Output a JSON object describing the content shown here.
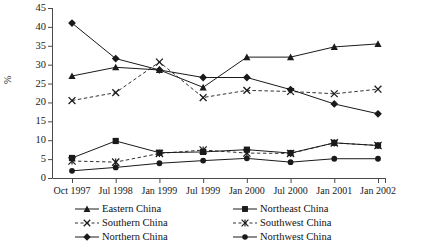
{
  "chart_data": {
    "type": "line",
    "title": "",
    "subtitle": "",
    "xlabel": "",
    "ylabel": "%",
    "ylim": [
      0,
      45
    ],
    "ytick_step": 5,
    "yticks": [
      45,
      40,
      35,
      30,
      25,
      20,
      15,
      10,
      5,
      0
    ],
    "grid": false,
    "legend_position": "bottom",
    "categories": [
      "Oct 1997",
      "Jul 1998",
      "Jan 1999",
      "Jul 1999",
      "Jan 2000",
      "Jul 2000",
      "Jan 2001",
      "Jan 2002"
    ],
    "series": [
      {
        "name": "Eastern China",
        "marker": "triangle",
        "line_style": "solid",
        "color": "#1a1a1a",
        "values": [
          27,
          29.3,
          28.6,
          24,
          32,
          32,
          34.7,
          35.5
        ]
      },
      {
        "name": "Northeast China",
        "marker": "square",
        "line_style": "solid",
        "color": "#1a1a1a",
        "values": [
          5.3,
          9.8,
          6.7,
          6.9,
          7.5,
          6.6,
          9.3,
          8.6
        ]
      },
      {
        "name": "Southern China",
        "marker": "cross",
        "line_style": "dashed",
        "color": "#1a1a1a",
        "values": [
          20.5,
          22.6,
          30.7,
          21.3,
          23.2,
          22.9,
          22.3,
          23.5
        ]
      },
      {
        "name": "Southwest China",
        "marker": "asterisk",
        "line_style": "dashed",
        "color": "#1a1a1a",
        "values": [
          4.5,
          4.2,
          6.5,
          7.4,
          6.6,
          6.5,
          9.3,
          8.6
        ]
      },
      {
        "name": "Northern China",
        "marker": "diamond",
        "line_style": "solid",
        "color": "#1a1a1a",
        "values": [
          41,
          31.6,
          28.6,
          26.6,
          26.6,
          23.4,
          19.6,
          17
        ]
      },
      {
        "name": "Northwest China",
        "marker": "circle",
        "line_style": "solid",
        "color": "#1a1a1a",
        "values": [
          1.9,
          2.8,
          3.9,
          4.6,
          5.2,
          4.2,
          5.1,
          5.1
        ]
      }
    ]
  },
  "axis": {
    "y_title": "%"
  },
  "legend": {
    "entries": [
      {
        "label": "Eastern China",
        "marker": "triangle",
        "line_style": "solid"
      },
      {
        "label": "Northeast China",
        "marker": "square",
        "line_style": "solid"
      },
      {
        "label": "Southern China",
        "marker": "cross",
        "line_style": "dashed"
      },
      {
        "label": "Southwest China",
        "marker": "asterisk",
        "line_style": "dashed"
      },
      {
        "label": "Northern China",
        "marker": "diamond",
        "line_style": "solid"
      },
      {
        "label": "Northwest China",
        "marker": "circle",
        "line_style": "solid"
      }
    ]
  }
}
